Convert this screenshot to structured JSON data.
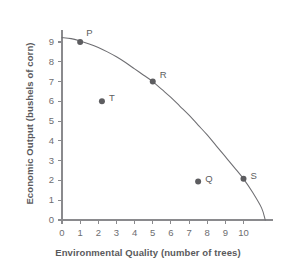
{
  "chart_data": {
    "type": "line",
    "title": "",
    "xlabel": "Environmental Quality (number of trees)",
    "ylabel": "Economic Output (bushels of corn)",
    "xlim": [
      0,
      11.6
    ],
    "ylim": [
      0,
      9.6
    ],
    "xticks": [
      "0",
      "1",
      "2",
      "3",
      "4",
      "5",
      "6",
      "7",
      "8",
      "9",
      "10"
    ],
    "xtick_values": [
      0,
      1,
      2,
      3,
      4,
      5,
      6,
      7,
      8,
      9,
      10
    ],
    "yticks": [
      "0",
      "1",
      "2",
      "3",
      "4",
      "5",
      "6",
      "7",
      "8",
      "9"
    ],
    "ytick_values": [
      0,
      1,
      2,
      3,
      4,
      5,
      6,
      7,
      8,
      9
    ],
    "grid": false,
    "legend": "none",
    "series": [
      {
        "name": "production possibilities frontier",
        "type": "curve",
        "color": "#6e6e72",
        "x": [
          0,
          0.5,
          1,
          1.5,
          2,
          2.5,
          3,
          3.5,
          4,
          4.5,
          5,
          5.5,
          6,
          6.5,
          7,
          7.5,
          8,
          8.5,
          9,
          9.5,
          10,
          10.5,
          11,
          11.2
        ],
        "y": [
          9.22,
          9.17,
          9.05,
          8.9,
          8.72,
          8.5,
          8.25,
          7.96,
          7.64,
          7.32,
          7.0,
          6.6,
          6.2,
          5.75,
          5.3,
          4.8,
          4.3,
          3.75,
          3.2,
          2.65,
          2.08,
          1.4,
          0.6,
          0.0
        ]
      }
    ],
    "points": [
      {
        "label": "P",
        "x": 1.0,
        "y": 9.0,
        "on_curve": true,
        "label_dx": 6,
        "label_dy": -11,
        "color": "#5d5d60"
      },
      {
        "label": "R",
        "x": 5.0,
        "y": 7.0,
        "on_curve": true,
        "label_dx": 7,
        "label_dy": -9,
        "color": "#5d5d60"
      },
      {
        "label": "T",
        "x": 2.2,
        "y": 6.0,
        "on_curve": false,
        "label_dx": 7,
        "label_dy": -5,
        "color": "#5d5d60"
      },
      {
        "label": "Q",
        "x": 7.5,
        "y": 1.95,
        "on_curve": false,
        "label_dx": 7,
        "label_dy": -4,
        "color": "#5d5d60"
      },
      {
        "label": "S",
        "x": 10.0,
        "y": 2.08,
        "on_curve": true,
        "label_dx": 7,
        "label_dy": -5,
        "color": "#5d5d60"
      }
    ],
    "axis_color": "#8a8a8d",
    "marker_radius": 3.0
  }
}
